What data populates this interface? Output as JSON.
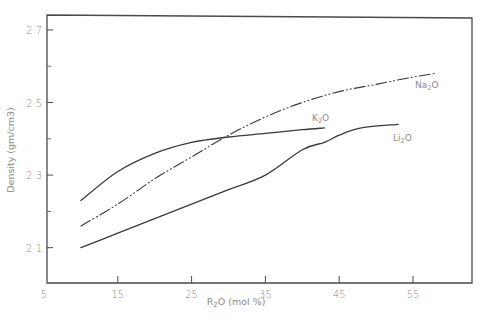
{
  "chart_data": {
    "type": "line",
    "title": "",
    "xlabel": "R2O (mol %)",
    "ylabel": "Density (gm/cm3)",
    "xlim": [
      5,
      63
    ],
    "ylim": [
      2.0,
      2.74
    ],
    "grid": false,
    "legend_position": "inline labels near line ends",
    "x_ticks": [
      5,
      15,
      25,
      35,
      45,
      55
    ],
    "x_tick_labels": [
      "5",
      "15",
      "25",
      "35",
      "45",
      "55"
    ],
    "y_ticks": [
      2.1,
      2.3,
      2.5,
      2.7
    ],
    "y_tick_labels": [
      "2·1",
      "2·3",
      "2·5",
      "2·7"
    ],
    "y_minor_ticks": [
      2.2,
      2.4,
      2.6
    ],
    "series": [
      {
        "name": "K2O",
        "label_main": "K",
        "label_sub": "2",
        "label_tail": "O",
        "style": "solid",
        "x": [
          10,
          15,
          20,
          25,
          30,
          35,
          40,
          43
        ],
        "y": [
          2.23,
          2.31,
          2.36,
          2.39,
          2.405,
          2.415,
          2.425,
          2.43
        ]
      },
      {
        "name": "Na2O",
        "label_main": "Na",
        "label_sub": "2",
        "label_tail": "O",
        "style": "dash-dot",
        "x": [
          10,
          15,
          20,
          25,
          30,
          35,
          40,
          45,
          50,
          55,
          58
        ],
        "y": [
          2.16,
          2.22,
          2.29,
          2.35,
          2.41,
          2.46,
          2.5,
          2.53,
          2.55,
          2.57,
          2.58
        ]
      },
      {
        "name": "Li2O",
        "label_main": "Li",
        "label_sub": "2",
        "label_tail": "O",
        "style": "solid",
        "x": [
          10,
          15,
          20,
          25,
          30,
          35,
          40,
          43,
          45,
          48,
          53
        ],
        "y": [
          2.1,
          2.14,
          2.18,
          2.22,
          2.26,
          2.3,
          2.37,
          2.39,
          2.41,
          2.43,
          2.44
        ]
      }
    ]
  },
  "axes": {
    "x_title_main": "R",
    "x_title_sub": "2",
    "x_title_tail": "O (mol %)",
    "y_title": "Density (gm/cm3)"
  }
}
